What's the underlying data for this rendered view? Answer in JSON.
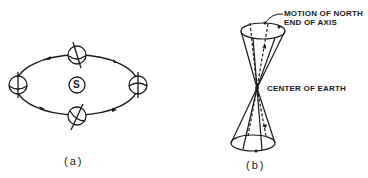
{
  "panel_a": {
    "caption": "(a)",
    "sun_label": "S",
    "description": "Earth's orbit around the Sun with tilted axis shown at four positions",
    "orbit": {
      "cx": 77,
      "cy": 85,
      "rx": 62,
      "ry": 31
    },
    "earth_positions": [
      "top",
      "right",
      "bottom",
      "left"
    ]
  },
  "panel_b": {
    "caption": "(b)",
    "labels": {
      "motion_line1": "MOTION OF NORTH",
      "motion_line2": "END OF AXIS",
      "center": "CENTER OF EARTH"
    },
    "description": "Double cone showing precession of Earth's axis"
  },
  "colors": {
    "ink": "#1a1a1a",
    "background": "#ffffff"
  }
}
